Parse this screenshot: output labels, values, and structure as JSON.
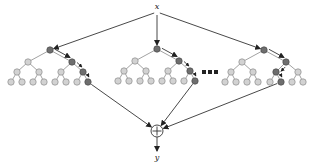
{
  "diagram": {
    "title": "",
    "input_label": "x",
    "output_label": "y",
    "combiner_symbol": "+",
    "ellipsis": "...",
    "colors": {
      "background": "#ffffff",
      "node_light": "#d2d2d2",
      "node_dark": "#6e6e6e",
      "edge": "#8a8a8a",
      "arrow": "#333333"
    },
    "input_node": {
      "x": 157,
      "y": 12
    },
    "sum_node": {
      "x": 157,
      "y": 131,
      "r": 6
    },
    "output_node": {
      "x": 157,
      "y": 157
    },
    "ellipsis_pos": {
      "x": 210,
      "y": 72
    },
    "trees": [
      {
        "name": "tree-1",
        "root": {
          "x": 50,
          "y": 50
        },
        "level1": [
          {
            "x": 28,
            "y": 62
          },
          {
            "x": 72,
            "y": 62
          }
        ],
        "level2": [
          {
            "x": 17,
            "y": 72
          },
          {
            "x": 39,
            "y": 72
          },
          {
            "x": 61,
            "y": 72
          },
          {
            "x": 83,
            "y": 72
          }
        ],
        "leaves_y": 82,
        "leaves_x": [
          11,
          22,
          33,
          44,
          55,
          66,
          77,
          88
        ],
        "path": {
          "level1": 1,
          "level2": 3,
          "leaf": 7
        }
      },
      {
        "name": "tree-2",
        "root": {
          "x": 157,
          "y": 49
        },
        "level1": [
          {
            "x": 135,
            "y": 61
          },
          {
            "x": 179,
            "y": 61
          }
        ],
        "level2": [
          {
            "x": 124,
            "y": 71
          },
          {
            "x": 146,
            "y": 71
          },
          {
            "x": 168,
            "y": 71
          },
          {
            "x": 190,
            "y": 71
          }
        ],
        "leaves_y": 81,
        "leaves_x": [
          118,
          129,
          140,
          151,
          162,
          173,
          184,
          195
        ],
        "path": {
          "level1": 1,
          "level2": 3,
          "leaf": 7
        }
      },
      {
        "name": "tree-3",
        "root": {
          "x": 264,
          "y": 50
        },
        "level1": [
          {
            "x": 242,
            "y": 62
          },
          {
            "x": 286,
            "y": 62
          }
        ],
        "level2": [
          {
            "x": 231,
            "y": 72
          },
          {
            "x": 253,
            "y": 72
          },
          {
            "x": 276,
            "y": 72
          },
          {
            "x": 298,
            "y": 72
          }
        ],
        "leaves_y": 82,
        "leaves_x": [
          225,
          236,
          247,
          258,
          270,
          281,
          292,
          303
        ],
        "path": {
          "level1": 1,
          "level2": 2,
          "leaf": 5
        }
      }
    ]
  }
}
